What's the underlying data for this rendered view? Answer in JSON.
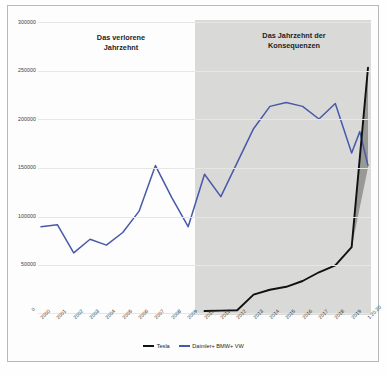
{
  "chart_data": {
    "type": "line",
    "title": "",
    "xlabel": "",
    "ylabel": "",
    "ylim": [
      0,
      300000
    ],
    "yticks": [
      "0",
      "50000",
      "100000",
      "150000",
      "200000",
      "250000",
      "300000"
    ],
    "grid": true,
    "legend_position": "bottom-center",
    "categories": [
      "2000",
      "2001",
      "2002",
      "2003",
      "2004",
      "2005",
      "2006",
      "2007",
      "2008",
      "2009",
      "2010",
      "2011",
      "2012",
      "2013",
      "2014",
      "2015",
      "2016",
      "2017",
      "2018",
      "2019",
      "1.20.20"
    ],
    "series": [
      {
        "name": "Tesla",
        "color": "#111111",
        "values": [
          null,
          null,
          null,
          null,
          null,
          null,
          null,
          null,
          null,
          null,
          2000,
          2400,
          2800,
          19000,
          24000,
          27000,
          33000,
          42000,
          49000,
          68000,
          253000
        ]
      },
      {
        "name": "Daimler+ BMW+ VW",
        "color": "#4759a8",
        "values": [
          89000,
          91000,
          62000,
          76000,
          70000,
          83000,
          105000,
          152000,
          119000,
          89000,
          143000,
          120000,
          155000,
          190000,
          213000,
          217000,
          213000,
          200000,
          216000,
          165000,
          152000
        ]
      }
    ],
    "annotations": [
      {
        "id": "band-left",
        "text": "Das verlorene\nJahrzehnt",
        "x_range": [
          "2000",
          "2009"
        ]
      },
      {
        "id": "band-right",
        "text": "Das Jahrzehnt der\nKonsequenzen",
        "x_range": [
          "2010",
          "1.20.20"
        ],
        "shaded": true,
        "shade_color": "#d9d9d7"
      }
    ],
    "extra_point": {
      "label": "2019-peak-blue",
      "value": 187000,
      "note": "blue spike before final drop"
    }
  },
  "legend": {
    "items": [
      {
        "label": "Tesla",
        "color": "#111111"
      },
      {
        "label": "Daimler+ BMW+ VW",
        "color": "#4759a8"
      }
    ]
  },
  "zero_tick": "0"
}
